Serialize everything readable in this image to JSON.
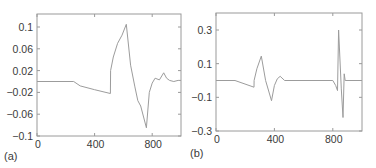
{
  "colors": {
    "line": "#9c9c9c",
    "frame": "#9a9a9a",
    "text": "#3a3a3a"
  },
  "chart_data": [
    {
      "type": "line",
      "panel_label": "(a)",
      "title": "",
      "xlabel": "",
      "ylabel": "",
      "xlim": [
        0,
        1000
      ],
      "ylim": [
        -0.1,
        0.12
      ],
      "grid": false,
      "xticks": [
        0,
        400,
        800
      ],
      "xtick_labels": [
        "0",
        "400",
        "800"
      ],
      "yticks": [
        0.1,
        0.06,
        0.02,
        -0.02,
        -0.06,
        -0.1
      ],
      "ytick_labels": [
        "0.1",
        "0.06",
        "0.02",
        "−0.02",
        "−0.06",
        "−0.1"
      ],
      "series": [
        {
          "name": "signal-a",
          "x": [
            0,
            255,
            300,
            400,
            510,
            511,
            530,
            560,
            590,
            620,
            650,
            680,
            700,
            720,
            760,
            780,
            800,
            820,
            850,
            880,
            900,
            920,
            950,
            980,
            1000
          ],
          "y": [
            0,
            0,
            -0.008,
            -0.015,
            -0.022,
            0.02,
            0.045,
            0.07,
            0.085,
            0.105,
            0.03,
            -0.01,
            -0.035,
            -0.045,
            -0.085,
            -0.02,
            -0.003,
            0.006,
            0.003,
            0.016,
            0.006,
            0.002,
            0.0,
            0.002,
            0.002
          ]
        }
      ]
    },
    {
      "type": "line",
      "panel_label": "(b)",
      "title": "",
      "xlabel": "",
      "ylabel": "",
      "xlim": [
        0,
        1000
      ],
      "ylim": [
        -0.3,
        0.38
      ],
      "grid": false,
      "xticks": [
        0,
        400,
        800
      ],
      "xtick_labels": [
        "0",
        "400",
        "800"
      ],
      "yticks": [
        0.3,
        0.1,
        -0.1,
        -0.3
      ],
      "ytick_labels": [
        "0.3",
        "0.1",
        "−0.1",
        "−0.3"
      ],
      "series": [
        {
          "name": "signal-b",
          "x": [
            0,
            130,
            260,
            261,
            280,
            310,
            340,
            380,
            400,
            420,
            440,
            470,
            800,
            820,
            832,
            840,
            858,
            870,
            878,
            885,
            1000
          ],
          "y": [
            0,
            0,
            -0.04,
            0.0,
            0.07,
            0.145,
            0.0,
            -0.12,
            -0.03,
            0.01,
            0.025,
            0.0,
            0.0,
            -0.03,
            -0.06,
            0.3,
            -0.05,
            -0.22,
            0.04,
            0.0,
            0.0
          ]
        }
      ]
    }
  ]
}
